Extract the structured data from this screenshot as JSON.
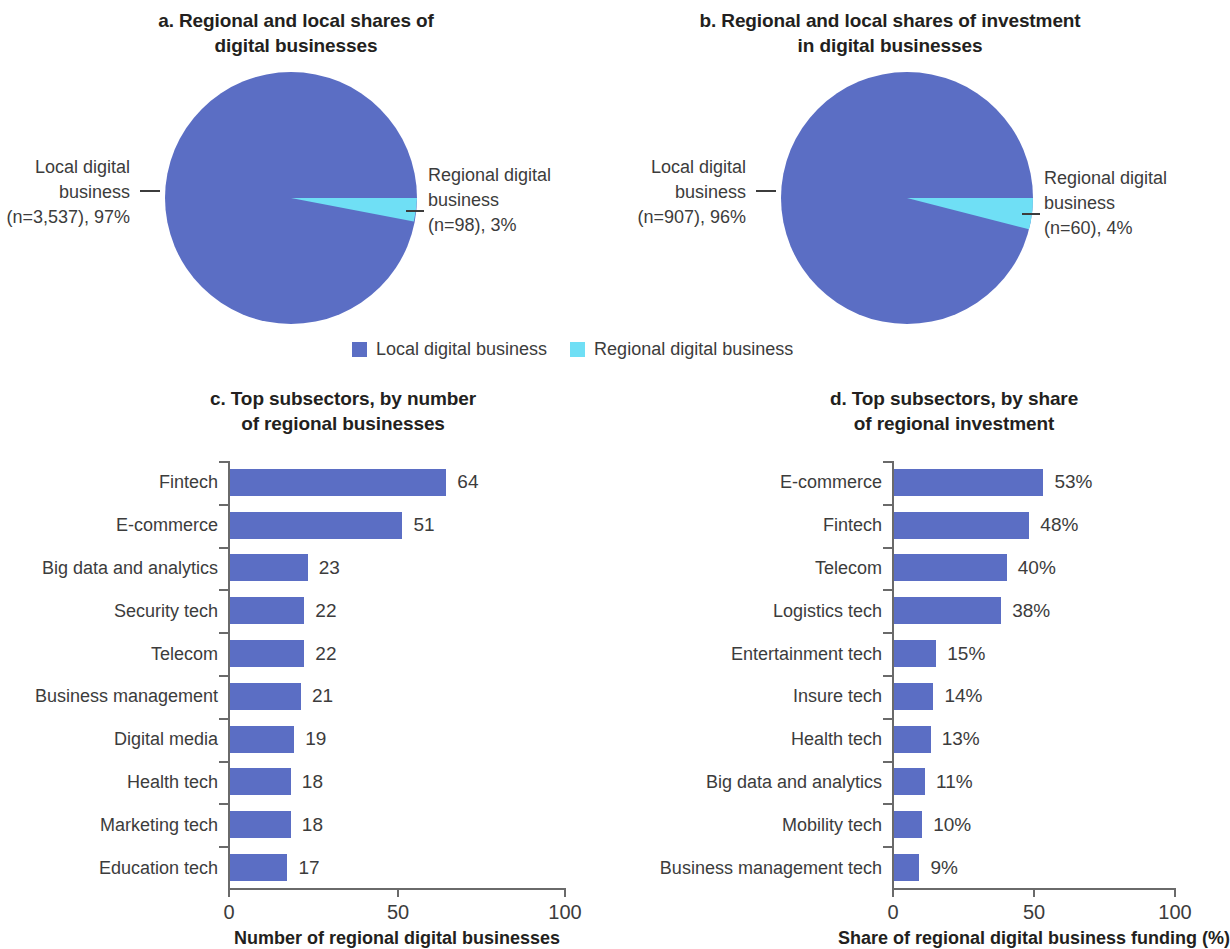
{
  "colors": {
    "local": "#5b6ec4",
    "regional": "#6fdff5",
    "text": "#3c3c3c",
    "axis": "#6a6a6a"
  },
  "legend": {
    "items": [
      {
        "label": "Local digital business",
        "color_key": "local"
      },
      {
        "label": "Regional digital business",
        "color_key": "regional"
      }
    ]
  },
  "panel_a": {
    "title_line1": "a. Regional and local shares of",
    "title_line2": "digital businesses",
    "left_label_line1": "Local digital",
    "left_label_line2": "business",
    "left_label_line3": "(n=3,537), 97%",
    "right_label_line1": "Regional digital",
    "right_label_line2": "business",
    "right_label_line3": "(n=98), 3%"
  },
  "panel_b": {
    "title_line1": "b. Regional and local shares of investment",
    "title_line2": "in digital businesses",
    "left_label_line1": "Local digital",
    "left_label_line2": "business",
    "left_label_line3": "(n=907), 96%",
    "right_label_line1": "Regional digital",
    "right_label_line2": "business",
    "right_label_line3": "(n=60), 4%"
  },
  "panel_c": {
    "title_line1": "c. Top subsectors, by number",
    "title_line2": "of regional businesses",
    "axis_title": "Number of regional digital businesses",
    "xticks": [
      "0",
      "50",
      "100"
    ]
  },
  "panel_d": {
    "title_line1": "d. Top subsectors, by share",
    "title_line2": "of regional investment",
    "axis_title": "Share of regional digital business funding (%)",
    "xticks": [
      "0",
      "50",
      "100"
    ]
  },
  "chart_data": [
    {
      "id": "a",
      "type": "pie",
      "title": "a. Regional and local shares of digital businesses",
      "legend_position": "bottom-center",
      "slices": [
        {
          "name": "Local digital business",
          "value": 97,
          "n": 3537,
          "label": "Local digital business (n=3,537), 97%",
          "color": "#5b6ec4"
        },
        {
          "name": "Regional digital business",
          "value": 3,
          "n": 98,
          "label": "Regional digital business (n=98), 3%",
          "color": "#6fdff5"
        }
      ]
    },
    {
      "id": "b",
      "type": "pie",
      "title": "b. Regional and local shares of investment in digital businesses",
      "legend_position": "bottom-center",
      "slices": [
        {
          "name": "Local digital business",
          "value": 96,
          "n": 907,
          "label": "Local digital business (n=907), 96%",
          "color": "#5b6ec4"
        },
        {
          "name": "Regional digital business",
          "value": 4,
          "n": 60,
          "label": "Regional digital business (n=60), 4%",
          "color": "#6fdff5"
        }
      ]
    },
    {
      "id": "c",
      "type": "bar",
      "orientation": "horizontal",
      "title": "c. Top subsectors, by number of regional businesses",
      "xlabel": "Number of regional digital businesses",
      "ylabel": "",
      "xlim": [
        0,
        100
      ],
      "xticks": [
        0,
        50,
        100
      ],
      "grid": false,
      "categories": [
        "Fintech",
        "E-commerce",
        "Big data and analytics",
        "Security tech",
        "Telecom",
        "Business management",
        "Digital media",
        "Health tech",
        "Marketing tech",
        "Education tech"
      ],
      "values": [
        64,
        51,
        23,
        22,
        22,
        21,
        19,
        18,
        18,
        17
      ],
      "value_labels": [
        "64",
        "51",
        "23",
        "22",
        "22",
        "21",
        "19",
        "18",
        "18",
        "17"
      ],
      "color": "#5b6ec4"
    },
    {
      "id": "d",
      "type": "bar",
      "orientation": "horizontal",
      "title": "d. Top subsectors, by share of regional investment",
      "xlabel": "Share of regional digital business funding (%)",
      "ylabel": "",
      "xlim": [
        0,
        100
      ],
      "xticks": [
        0,
        50,
        100
      ],
      "grid": false,
      "categories": [
        "E-commerce",
        "Fintech",
        "Telecom",
        "Logistics tech",
        "Entertainment tech",
        "Insure tech",
        "Health tech",
        "Big data and analytics",
        "Mobility tech",
        "Business management tech"
      ],
      "values": [
        53,
        48,
        40,
        38,
        15,
        14,
        13,
        11,
        10,
        9
      ],
      "value_labels": [
        "53%",
        "48%",
        "40%",
        "38%",
        "15%",
        "14%",
        "13%",
        "11%",
        "10%",
        "9%"
      ],
      "color": "#5b6ec4"
    }
  ]
}
